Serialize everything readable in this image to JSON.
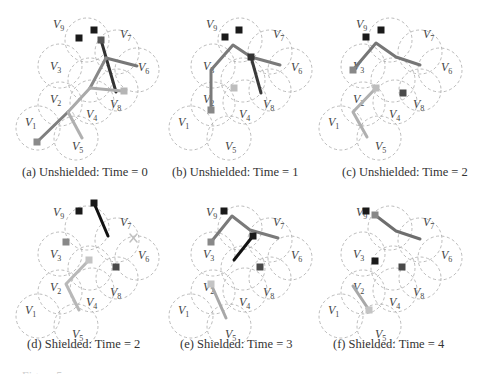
{
  "figure": {
    "panels": [
      {
        "id": "a",
        "caption": "(a) Unshielded: Time = 0",
        "offset": [
          0,
          0
        ],
        "caption_pos": [
          22,
          165
        ],
        "edges": [
          {
            "pts": [
              [
                101,
                40
              ],
              [
                116,
                92
              ]
            ],
            "color": "#333333",
            "w": 3
          },
          {
            "pts": [
              [
                106,
                58
              ],
              [
                137,
                66
              ]
            ],
            "color": "#777777",
            "w": 3
          },
          {
            "pts": [
              [
                106,
                58
              ],
              [
                90,
                88
              ]
            ],
            "color": "#888888",
            "w": 3
          },
          {
            "pts": [
              [
                90,
                88
              ],
              [
                122,
                91
              ]
            ],
            "color": "#aaaaaa",
            "w": 3
          },
          {
            "pts": [
              [
                90,
                88
              ],
              [
                68,
                112
              ]
            ],
            "color": "#aaaaaa",
            "w": 3
          },
          {
            "pts": [
              [
                68,
                112
              ],
              [
                37,
                142
              ]
            ],
            "color": "#7f7f7f",
            "w": 3
          },
          {
            "pts": [
              [
                68,
                112
              ],
              [
                82,
                138
              ]
            ],
            "color": "#b0b0b0",
            "w": 3
          }
        ],
        "nodes": [
          {
            "pos": [
              79,
              38
            ],
            "color": "#1a1a1a"
          },
          {
            "pos": [
              94,
              30
            ],
            "color": "#1a1a1a"
          },
          {
            "pos": [
              101,
              40
            ],
            "color": "#555555"
          },
          {
            "pos": [
              124,
              91
            ],
            "color": "#b5b5b5"
          },
          {
            "pos": [
              37,
              142
            ],
            "color": "#8a8a8a"
          }
        ]
      },
      {
        "id": "b",
        "caption": "(b) Unshielded: Time = 1",
        "offset": [
          153,
          0
        ],
        "caption_pos": [
          172,
          165
        ],
        "edges": [
          {
            "pts": [
              [
                58,
                110
              ],
              [
                58,
                70
              ],
              [
                80,
                45
              ],
              [
                98,
                57
              ],
              [
                127,
                65
              ]
            ],
            "color": "#7a7a7a",
            "w": 3
          },
          {
            "pts": [
              [
                98,
                57
              ],
              [
                108,
                93
              ]
            ],
            "color": "#3a3a3a",
            "w": 3
          }
        ],
        "nodes": [
          {
            "pos": [
              72,
              37
            ],
            "color": "#1a1a1a"
          },
          {
            "pos": [
              86,
              30
            ],
            "color": "#1a1a1a"
          },
          {
            "pos": [
              98,
              57
            ],
            "color": "#333333"
          },
          {
            "pos": [
              81,
              88
            ],
            "color": "#bdbdbd"
          },
          {
            "pos": [
              58,
              110
            ],
            "color": "#888888"
          }
        ]
      },
      {
        "id": "c",
        "caption": "(c) Unshielded: Time = 2",
        "offset": [
          303,
          0
        ],
        "caption_pos": [
          342,
          165
        ],
        "edges": [
          {
            "pts": [
              [
                50,
                70
              ],
              [
                73,
                43
              ],
              [
                93,
                57
              ],
              [
                117,
                65
              ]
            ],
            "color": "#767676",
            "w": 3
          },
          {
            "pts": [
              [
                73,
                88
              ],
              [
                50,
                112
              ],
              [
                64,
                137
              ]
            ],
            "color": "#b0b0b0",
            "w": 3
          }
        ],
        "nodes": [
          {
            "pos": [
              63,
              37
            ],
            "color": "#1a1a1a"
          },
          {
            "pos": [
              78,
              30
            ],
            "color": "#1a1a1a"
          },
          {
            "pos": [
              50,
              70
            ],
            "color": "#888888"
          },
          {
            "pos": [
              73,
              88
            ],
            "color": "#bdbdbd"
          },
          {
            "pos": [
              100,
              93
            ],
            "color": "#4a4a4a"
          }
        ]
      },
      {
        "id": "d",
        "caption": "(d) Shielded: Time = 2",
        "offset": [
          0,
          188
        ],
        "caption_pos": [
          27,
          337
        ],
        "edges": [
          {
            "pts": [
              [
                94,
                15
              ],
              [
                108,
                48
              ]
            ],
            "color": "#111111",
            "w": 3
          },
          {
            "pts": [
              [
                89,
                72
              ],
              [
                66,
                96
              ],
              [
                79,
                122
              ]
            ],
            "color": "#b8b8b8",
            "w": 3
          },
          {
            "pts": [
              [
                130,
                46
              ],
              [
                137,
                54
              ]
            ],
            "color": "#c0c0c0",
            "w": 1.5
          },
          {
            "pts": [
              [
                137,
                46
              ],
              [
                130,
                54
              ]
            ],
            "color": "#c0c0c0",
            "w": 1.5
          }
        ],
        "nodes": [
          {
            "pos": [
              79,
              23
            ],
            "color": "#1a1a1a"
          },
          {
            "pos": [
              94,
              15
            ],
            "color": "#1a1a1a"
          },
          {
            "pos": [
              66,
              54
            ],
            "color": "#888888"
          },
          {
            "pos": [
              89,
              72
            ],
            "color": "#c4c4c4"
          },
          {
            "pos": [
              116,
              79
            ],
            "color": "#4a4a4a"
          }
        ]
      },
      {
        "id": "d2",
        "caption": "",
        "offset": [
          0,
          0
        ],
        "caption_pos": [
          0,
          0
        ],
        "edges": [],
        "nodes": []
      },
      {
        "id": "e",
        "caption": "(e) Shielded: Time = 3",
        "offset": [
          153,
          188
        ],
        "caption_pos": [
          180,
          337
        ],
        "edges": [
          {
            "pts": [
              [
                58,
                54
              ],
              [
                79,
                28
              ],
              [
                97,
                42
              ],
              [
                125,
                50
              ]
            ],
            "color": "#7a7a7a",
            "w": 3
          },
          {
            "pts": [
              [
                100,
                48
              ],
              [
                81,
                72
              ]
            ],
            "color": "#111111",
            "w": 3
          },
          {
            "pts": [
              [
                58,
                96
              ],
              [
                73,
                130
              ]
            ],
            "color": "#a8a8a8",
            "w": 3
          }
        ],
        "nodes": [
          {
            "pos": [
              71,
              23
            ],
            "color": "#1a1a1a"
          },
          {
            "pos": [
              58,
              54
            ],
            "color": "#888888"
          },
          {
            "pos": [
              100,
              48
            ],
            "color": "#1a1a1a"
          },
          {
            "pos": [
              58,
              96
            ],
            "color": "#c4c4c4"
          },
          {
            "pos": [
              107,
              79
            ],
            "color": "#4a4a4a"
          }
        ]
      },
      {
        "id": "f",
        "caption": "(f) Shielded: Time = 4",
        "offset": [
          303,
          188
        ],
        "caption_pos": [
          333,
          337
        ],
        "edges": [
          {
            "pts": [
              [
                72,
                27
              ],
              [
                93,
                43
              ],
              [
                117,
                51
              ]
            ],
            "color": "#6e6e6e",
            "w": 3
          },
          {
            "pts": [
              [
                50,
                98
              ],
              [
                66,
                122
              ]
            ],
            "color": "#a8a8a8",
            "w": 3
          }
        ],
        "nodes": [
          {
            "pos": [
              63,
              23
            ],
            "color": "#1a1a1a"
          },
          {
            "pos": [
              72,
              27
            ],
            "color": "#888888"
          },
          {
            "pos": [
              72,
              73
            ],
            "color": "#1a1a1a"
          },
          {
            "pos": [
              99,
              79
            ],
            "color": "#4a4a4a"
          },
          {
            "pos": [
              66,
              122
            ],
            "color": "#c4c4c4"
          }
        ]
      }
    ],
    "circles": [
      {
        "c": [
          87,
          40
        ],
        "r": 22
      },
      {
        "c": [
          117,
          52
        ],
        "r": 22
      },
      {
        "c": [
          60,
          66
        ],
        "r": 22
      },
      {
        "c": [
          137,
          70
        ],
        "r": 22
      },
      {
        "c": [
          90,
          80
        ],
        "r": 22
      },
      {
        "c": [
          117,
          90
        ],
        "r": 21
      },
      {
        "c": [
          92,
          102
        ],
        "r": 22
      },
      {
        "c": [
          60,
          104
        ],
        "r": 22
      },
      {
        "c": [
          38,
          128
        ],
        "r": 22
      },
      {
        "c": [
          76,
          138
        ],
        "r": 22
      }
    ],
    "labels": [
      {
        "name": "V",
        "sub": "9",
        "pos": [
          53,
          28
        ]
      },
      {
        "name": "V",
        "sub": "7",
        "pos": [
          120,
          38
        ]
      },
      {
        "name": "V",
        "sub": "3",
        "pos": [
          50,
          70
        ]
      },
      {
        "name": "V",
        "sub": "6",
        "pos": [
          138,
          71
        ]
      },
      {
        "name": "V",
        "sub": "2",
        "pos": [
          50,
          103
        ]
      },
      {
        "name": "V",
        "sub": "8",
        "pos": [
          110,
          108
        ]
      },
      {
        "name": "V",
        "sub": "4",
        "pos": [
          86,
          118
        ]
      },
      {
        "name": "V",
        "sub": "1",
        "pos": [
          25,
          126
        ]
      },
      {
        "name": "V",
        "sub": "5",
        "pos": [
          72,
          150
        ]
      }
    ],
    "bottom_cutoff_text": "Figure 5: ..."
  }
}
